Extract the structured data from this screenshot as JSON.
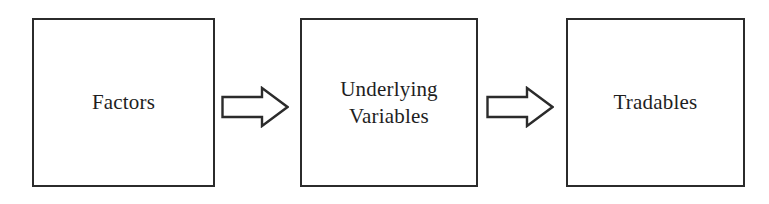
{
  "diagram": {
    "type": "flow-diagram",
    "orientation": "left-to-right",
    "background_color": "#ffffff",
    "line_color": "#2b2b2b",
    "text_color": "#1e1e1e",
    "nodes": [
      {
        "id": "factors",
        "label": "Factors",
        "shape": "rectangle",
        "order": 1
      },
      {
        "id": "underlying-variables",
        "label": "Underlying\nVariables",
        "line1": "Underlying",
        "line2": "Variables",
        "shape": "rectangle",
        "order": 2
      },
      {
        "id": "tradables",
        "label": "Tradables",
        "shape": "rectangle",
        "order": 3
      }
    ],
    "connectors": [
      {
        "id": "arrow-1",
        "icon": "block-arrow-right-icon",
        "direction": "right",
        "style": "hollow-block-arrow",
        "from": "factors",
        "to": "underlying-variables",
        "label": ""
      },
      {
        "id": "arrow-2",
        "icon": "block-arrow-right-icon",
        "direction": "right",
        "style": "hollow-block-arrow",
        "from": "underlying-variables",
        "to": "tradables",
        "label": ""
      }
    ]
  }
}
